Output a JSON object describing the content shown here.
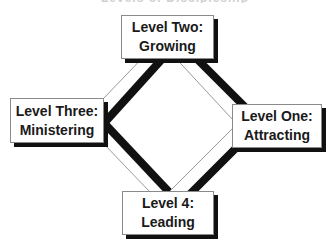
{
  "title": {
    "text": "Levels of Discipleship"
  },
  "levels": [
    {
      "id": "one",
      "line1": "Level One:",
      "line2": "Attracting",
      "position": "right"
    },
    {
      "id": "two",
      "line1": "Level Two:",
      "line2": "Growing",
      "position": "top"
    },
    {
      "id": "three",
      "line1": "Level Three:",
      "line2": "Ministering",
      "position": "left"
    },
    {
      "id": "four",
      "line1": "Level 4:",
      "line2": "Leading",
      "position": "bottom"
    }
  ],
  "colors": {
    "box_border": "#8a8a8a",
    "box_shadow": "#111111",
    "thick_line": "#111111",
    "thin_line": "#9a9a9a",
    "text": "#1a1a1a",
    "background": "#ffffff"
  }
}
